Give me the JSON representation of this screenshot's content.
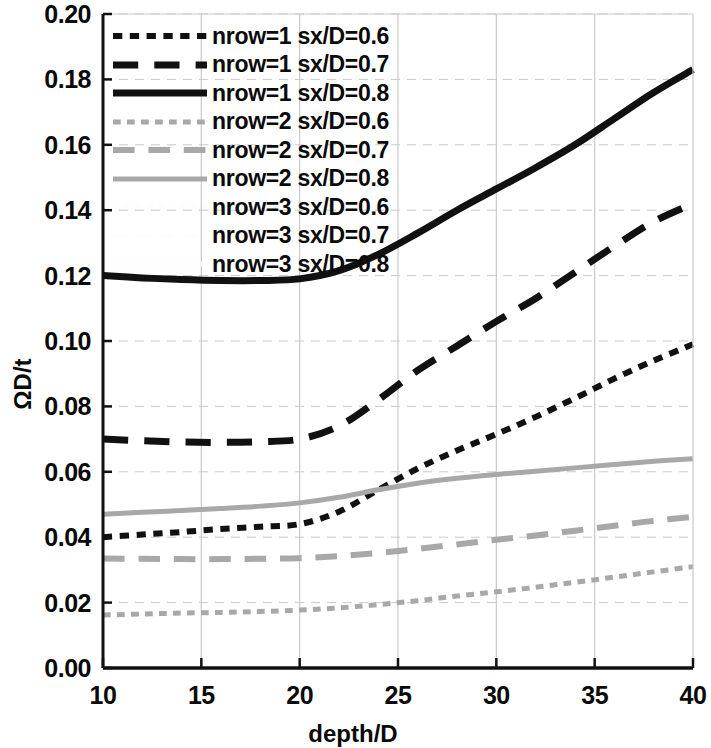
{
  "chart_data": {
    "type": "line",
    "title": "",
    "xlabel": "depth/D",
    "ylabel": "ΩD/t",
    "xlim": [
      10,
      40
    ],
    "ylim": [
      0.0,
      0.2
    ],
    "xticks": [
      "10",
      "15",
      "20",
      "25",
      "30",
      "35",
      "40"
    ],
    "yticks": [
      "0.00",
      "0.02",
      "0.04",
      "0.06",
      "0.08",
      "0.10",
      "0.12",
      "0.14",
      "0.16",
      "0.18",
      "0.20"
    ],
    "grid": true,
    "legend_position": "upper-left-inside",
    "x": [
      10,
      12,
      14,
      16,
      18,
      20,
      22,
      24,
      26,
      28,
      30,
      32,
      34,
      36,
      38,
      40
    ],
    "series": [
      {
        "name": "nrow=1 sx/D=0.6",
        "color": "#111111",
        "style": "short-dash",
        "width": 6,
        "values": [
          0.04,
          0.0408,
          0.0416,
          0.0425,
          0.0432,
          0.044,
          0.0478,
          0.0545,
          0.061,
          0.0665,
          0.0715,
          0.0768,
          0.0825,
          0.0885,
          0.094,
          0.099
        ]
      },
      {
        "name": "nrow=1 sx/D=0.7",
        "color": "#111111",
        "style": "long-dash",
        "width": 7,
        "values": [
          0.07,
          0.0695,
          0.0691,
          0.069,
          0.0692,
          0.07,
          0.074,
          0.082,
          0.091,
          0.0985,
          0.106,
          0.113,
          0.121,
          0.129,
          0.1365,
          0.142
        ]
      },
      {
        "name": "nrow=1 sx/D=0.8",
        "color": "#111111",
        "style": "solid",
        "width": 7,
        "values": [
          0.12,
          0.1193,
          0.1188,
          0.1185,
          0.1185,
          0.119,
          0.1215,
          0.1265,
          0.133,
          0.14,
          0.1465,
          0.153,
          0.16,
          0.168,
          0.176,
          0.183
        ]
      },
      {
        "name": "nrow=2 sx/D=0.6",
        "color": "#a8a8a8",
        "style": "short-dash",
        "width": 5,
        "values": [
          0.0162,
          0.0165,
          0.0168,
          0.017,
          0.0173,
          0.0177,
          0.0184,
          0.0194,
          0.0206,
          0.022,
          0.0233,
          0.0247,
          0.0262,
          0.0278,
          0.0294,
          0.031
        ]
      },
      {
        "name": "nrow=2 sx/D=0.7",
        "color": "#a8a8a8",
        "style": "long-dash",
        "width": 6,
        "values": [
          0.0335,
          0.0334,
          0.0333,
          0.0333,
          0.0334,
          0.0336,
          0.0342,
          0.0352,
          0.0364,
          0.0378,
          0.0392,
          0.0405,
          0.042,
          0.0435,
          0.045,
          0.0462
        ]
      },
      {
        "name": "nrow=2 sx/D=0.8",
        "color": "#a8a8a8",
        "style": "solid",
        "width": 5,
        "values": [
          0.047,
          0.0476,
          0.0482,
          0.0488,
          0.0495,
          0.0505,
          0.0522,
          0.0545,
          0.0565,
          0.058,
          0.0592,
          0.0602,
          0.0612,
          0.0622,
          0.0632,
          0.064
        ]
      },
      {
        "name": "nrow=3 sx/D=0.6",
        "color": "#fdfdfd",
        "style": "short-dash",
        "width": 4,
        "values": [
          0.0,
          0.0,
          0.0,
          0.0,
          0.0,
          0.0,
          0.0,
          0.0,
          0.0,
          0.0,
          0.0,
          0.0,
          0.0,
          0.0,
          0.0,
          0.0
        ]
      },
      {
        "name": "nrow=3 sx/D=0.7",
        "color": "#fdfdfd",
        "style": "long-dash",
        "width": 4,
        "values": [
          0.0,
          0.0,
          0.0,
          0.0,
          0.0,
          0.0,
          0.0,
          0.0,
          0.0,
          0.0,
          0.0,
          0.0,
          0.0,
          0.0,
          0.0,
          0.0
        ]
      },
      {
        "name": "nrow=3 sx/D=0.8",
        "color": "#fdfdfd",
        "style": "solid",
        "width": 4,
        "values": [
          0.0,
          0.0,
          0.0,
          0.0,
          0.0,
          0.0,
          0.0,
          0.0,
          0.0,
          0.0,
          0.0,
          0.0,
          0.0,
          0.0,
          0.0,
          0.0
        ]
      }
    ]
  },
  "colors": {
    "axis": "#111111",
    "grid": "#c9c9c9",
    "black_series": "#111111",
    "grey_series": "#a8a8a8",
    "background": "#ffffff"
  }
}
